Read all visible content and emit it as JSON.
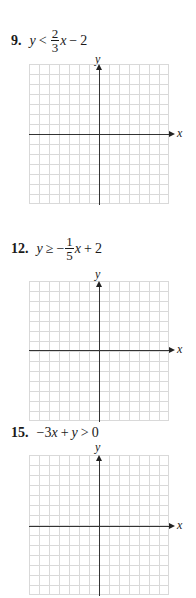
{
  "problems": [
    {
      "number": "9.",
      "lhs": "y",
      "relation": "<",
      "frac_num": "2",
      "frac_den": "3",
      "var": "x",
      "op": "−",
      "const": "2",
      "x_axis_label": "x",
      "y_axis_label": "y"
    },
    {
      "number": "12.",
      "lhs": "y",
      "relation": "≥",
      "sign": "−",
      "frac_num": "1",
      "frac_den": "5",
      "var": "x",
      "op": "+",
      "const": "2",
      "x_axis_label": "x",
      "y_axis_label": "y"
    },
    {
      "number": "15.",
      "coef": "−3",
      "var_x": "x",
      "op": "+",
      "var_y": "y",
      "relation": ">",
      "const": "0",
      "x_axis_label": "x",
      "y_axis_label": "y"
    }
  ],
  "grid": {
    "columns": 14,
    "rows": 14,
    "line_color": "#d9d9d9",
    "axis_color": "#333333"
  }
}
